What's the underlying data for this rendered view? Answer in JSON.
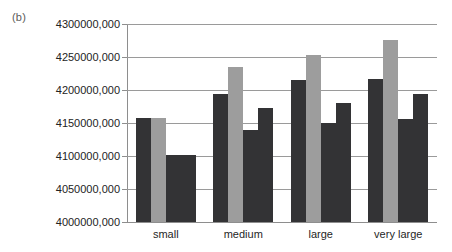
{
  "figure": {
    "panel_label": "(b)"
  },
  "chart_data": {
    "type": "bar",
    "title": "",
    "xlabel": "",
    "ylabel": "",
    "categories": [
      "small",
      "medium",
      "large",
      "very large"
    ],
    "ylim": [
      4000000000,
      4300000000
    ],
    "ytick_labels": [
      "4300000,000",
      "4250000,000",
      "4200000,000",
      "4150000,000",
      "4100000,000",
      "4050000,000",
      "4000000,000"
    ],
    "ytick_values": [
      4300000000,
      4250000000,
      4200000000,
      4150000000,
      4100000000,
      4050000000,
      4000000000
    ],
    "grid": true,
    "legend": "none",
    "series": [
      {
        "name": "series-1",
        "color": "#333335",
        "values": [
          4158000000,
          4194000000,
          4215000000,
          4217000000
        ]
      },
      {
        "name": "series-2",
        "color": "#9d9d9d",
        "values": [
          4158000000,
          4235000000,
          4253000000,
          4276000000
        ]
      },
      {
        "name": "series-3",
        "color": "#333335",
        "values": [
          4102000000,
          4140000000,
          4150000000,
          4156000000
        ]
      },
      {
        "name": "series-4",
        "color": "#333335",
        "values": [
          4102000000,
          4172000000,
          4181000000,
          4194000000
        ]
      }
    ]
  }
}
